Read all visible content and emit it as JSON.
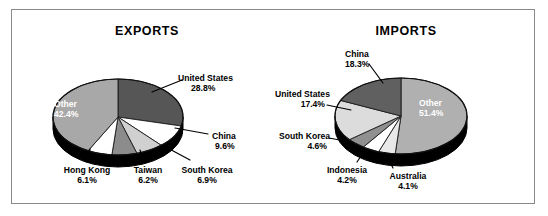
{
  "figure": {
    "width": 548,
    "height": 216,
    "background": "#ffffff",
    "border_color": "#8a8a8a"
  },
  "palette": {
    "dark_gray": "#565656",
    "mid_gray": "#808080",
    "light_gray": "#b4b4b4",
    "pale_gray": "#d8d8d8",
    "white": "#ffffff",
    "base_3d": "#000000",
    "label_text": "#000000",
    "inside_label_text": "#ffffff"
  },
  "charts": [
    {
      "id": "exports",
      "title": "EXPORTS",
      "slices": [
        {
          "name": "United States",
          "percent": "28.8%",
          "color": "#565656",
          "label_pos": "outside"
        },
        {
          "name": "China",
          "percent": "9.6%",
          "color": "#ffffff",
          "label_pos": "outside"
        },
        {
          "name": "South Korea",
          "percent": "6.9%",
          "color": "#d0d0d0",
          "label_pos": "outside"
        },
        {
          "name": "Taiwan",
          "percent": "6.2%",
          "color": "#8c8c8c",
          "label_pos": "outside"
        },
        {
          "name": "Hong Kong",
          "percent": "6.1%",
          "color": "#ffffff",
          "label_pos": "outside"
        },
        {
          "name": "Other",
          "percent": "42.4%",
          "color": "#a8a8a8",
          "label_pos": "inside"
        }
      ]
    },
    {
      "id": "imports",
      "title": "IMPORTS",
      "slices": [
        {
          "name": "Other",
          "percent": "51.4%",
          "color": "#b0b0b0",
          "label_pos": "inside"
        },
        {
          "name": "Australia",
          "percent": "4.1%",
          "color": "#e8e8e8",
          "label_pos": "outside"
        },
        {
          "name": "Indonesia",
          "percent": "4.2%",
          "color": "#ffffff",
          "label_pos": "outside"
        },
        {
          "name": "South Korea",
          "percent": "4.6%",
          "color": "#909090",
          "label_pos": "outside"
        },
        {
          "name": "United States",
          "percent": "17.4%",
          "color": "#dcdcdc",
          "label_pos": "outside"
        },
        {
          "name": "China",
          "percent": "18.3%",
          "color": "#606060",
          "label_pos": "outside"
        }
      ]
    }
  ],
  "chart_data": [
    {
      "type": "pie",
      "title": "EXPORTS",
      "xlabel": "",
      "ylabel": "",
      "legend": "none",
      "grid": false,
      "labels_show_percent": true,
      "categories": [
        "United States",
        "China",
        "South Korea",
        "Taiwan",
        "Hong Kong",
        "Other"
      ],
      "values": [
        28.8,
        9.6,
        6.9,
        6.2,
        6.1,
        42.4
      ],
      "value_labels": [
        "28.8%",
        "9.6%",
        "6.9%",
        "6.2%",
        "6.1%",
        "42.4%"
      ],
      "colors": [
        "#565656",
        "#ffffff",
        "#d0d0d0",
        "#8c8c8c",
        "#ffffff",
        "#a8a8a8"
      ],
      "start_angle_deg": 90,
      "direction": "clockwise",
      "three_d": true
    },
    {
      "type": "pie",
      "title": "IMPORTS",
      "xlabel": "",
      "ylabel": "",
      "legend": "none",
      "grid": false,
      "labels_show_percent": true,
      "categories": [
        "Other",
        "Australia",
        "Indonesia",
        "South Korea",
        "United States",
        "China"
      ],
      "values": [
        51.4,
        4.1,
        4.2,
        4.6,
        17.4,
        18.3
      ],
      "value_labels": [
        "51.4%",
        "4.1%",
        "4.2%",
        "4.6%",
        "17.4%",
        "18.3%"
      ],
      "colors": [
        "#b0b0b0",
        "#e8e8e8",
        "#ffffff",
        "#909090",
        "#dcdcdc",
        "#606060"
      ],
      "start_angle_deg": 90,
      "direction": "clockwise",
      "three_d": true
    }
  ]
}
